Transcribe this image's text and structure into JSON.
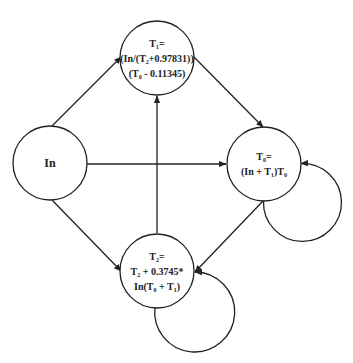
{
  "diagram": {
    "type": "state-transition",
    "colors": {
      "stroke": "#222222",
      "background": "#ffffff",
      "text": "#222222"
    },
    "nodes": [
      {
        "id": "In",
        "cx": 50,
        "cy": 163,
        "r": 37,
        "lines": [
          "In"
        ]
      },
      {
        "id": "T1",
        "cx": 157,
        "cy": 58,
        "r": 37,
        "lines": [
          "T₁=",
          "(In/(T₂+0.97831))",
          "(T₀ - 0.11345)"
        ]
      },
      {
        "id": "T0",
        "cx": 264,
        "cy": 164,
        "r": 37,
        "lines": [
          "T₀=",
          "(In + T₁)T₀"
        ]
      },
      {
        "id": "T2",
        "cx": 157,
        "cy": 271,
        "r": 37,
        "lines": [
          "T₂=",
          "T₂ + 0.3745*",
          "In(T₀ + T₁)"
        ]
      }
    ],
    "edges": [
      {
        "from": "In",
        "to": "T1",
        "kind": "straight"
      },
      {
        "from": "In",
        "to": "T0",
        "kind": "straight"
      },
      {
        "from": "In",
        "to": "T2",
        "kind": "straight"
      },
      {
        "from": "T1",
        "to": "T0",
        "kind": "straight"
      },
      {
        "from": "T2",
        "to": "T1",
        "kind": "straight"
      },
      {
        "from": "T0",
        "to": "T2",
        "kind": "straight"
      },
      {
        "from": "T0",
        "to": "T0",
        "kind": "self-loop"
      },
      {
        "from": "T2",
        "to": "T2",
        "kind": "self-loop"
      }
    ]
  }
}
